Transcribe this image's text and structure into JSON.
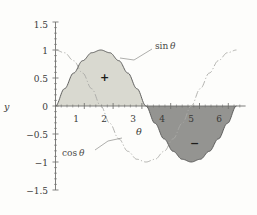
{
  "figure": {
    "background_color": "#fdfdfb",
    "axis_color": "#6f6f6d",
    "text_color": "#3a3a38"
  },
  "chart_data": {
    "type": "line",
    "title": "",
    "xlabel": "θ",
    "ylabel": "y",
    "xlim": [
      0,
      6.6
    ],
    "ylim": [
      -1.5,
      1.5
    ],
    "grid": false,
    "legend_position": "inline-annotations",
    "x_ticks": [
      1,
      2,
      3,
      4,
      5,
      6
    ],
    "x_tick_labels": [
      "1",
      "2",
      "3",
      "4",
      "5",
      "6"
    ],
    "y_ticks": [
      -1.5,
      -1,
      -0.5,
      0,
      0.5,
      1,
      1.5
    ],
    "y_tick_labels": [
      "−1.5",
      "−1",
      "−0.5",
      "0",
      "0.5",
      "1",
      "1.5"
    ],
    "series": [
      {
        "name": "sin θ",
        "style": "solid",
        "color": "#5a5a58",
        "x": [
          0,
          0.3142,
          0.6283,
          0.9425,
          1.2566,
          1.5708,
          1.885,
          2.1991,
          2.5133,
          2.8274,
          3.1416,
          3.4558,
          3.7699,
          4.0841,
          4.3982,
          4.7124,
          5.0265,
          5.3407,
          5.6549,
          5.969,
          6.2832
        ],
        "y": [
          0,
          0.309,
          0.5878,
          0.809,
          0.9511,
          1,
          0.9511,
          0.809,
          0.5878,
          0.309,
          0,
          -0.309,
          -0.5878,
          -0.809,
          -0.9511,
          -1,
          -0.9511,
          -0.809,
          -0.5878,
          -0.309,
          0
        ]
      },
      {
        "name": "cos θ",
        "style": "dash-dot",
        "color": "#a9a9a6",
        "x": [
          0,
          0.3142,
          0.6283,
          0.9425,
          1.2566,
          1.5708,
          1.885,
          2.1991,
          2.5133,
          2.8274,
          3.1416,
          3.4558,
          3.7699,
          4.0841,
          4.3982,
          4.7124,
          5.0265,
          5.3407,
          5.6549,
          5.969,
          6.2832
        ],
        "y": [
          1,
          0.9511,
          0.809,
          0.5878,
          0.309,
          0,
          -0.309,
          -0.5878,
          -0.809,
          -0.9511,
          -1,
          -0.9511,
          -0.809,
          -0.5878,
          -0.309,
          0,
          0.309,
          0.5878,
          0.809,
          0.9511,
          1
        ]
      }
    ],
    "shaded_regions": [
      {
        "label": "+",
        "sign": "positive",
        "x_range": [
          0,
          3.1416
        ],
        "fill_color": "#d9d9d0",
        "description": "area under sin θ from 0 to π"
      },
      {
        "label": "−",
        "sign": "negative",
        "x_range": [
          3.1416,
          6.2832
        ],
        "fill_color": "#949491",
        "description": "area under sin θ from π to 2π"
      }
    ],
    "annotations": [
      {
        "text": "sin θ",
        "target_series": "sin θ",
        "leader": true
      },
      {
        "text": "cos θ",
        "target_series": "cos θ",
        "leader": true
      },
      {
        "text": "+",
        "kind": "sign-mark"
      },
      {
        "text": "−",
        "kind": "sign-mark"
      }
    ]
  },
  "labels": {
    "y_axis_name": "y",
    "x_axis_name": "θ",
    "sin_annotation_fn": "sin",
    "sin_annotation_arg": "θ",
    "cos_annotation_fn": "cos",
    "cos_annotation_arg": "θ",
    "plus_sign": "+",
    "minus_sign": "−"
  }
}
